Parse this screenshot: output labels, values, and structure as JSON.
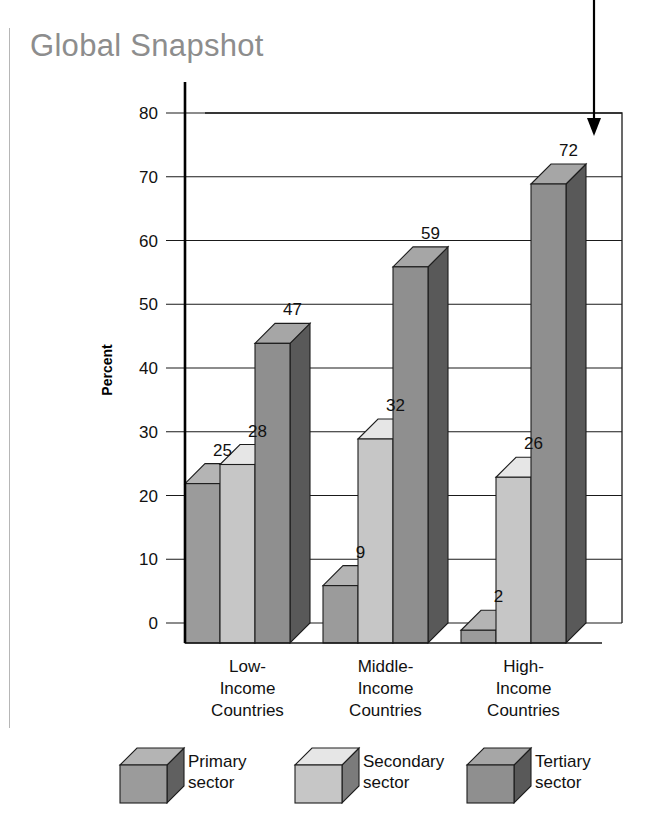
{
  "title": "Global Snapshot",
  "chart_data": {
    "type": "bar",
    "title": "Global Snapshot",
    "xlabel": "",
    "ylabel": "Percent",
    "ylim": [
      0,
      80
    ],
    "yticks": [
      0,
      10,
      20,
      30,
      40,
      50,
      60,
      70,
      80
    ],
    "ytick_labels": [
      "0",
      "10",
      "20",
      "30",
      "40",
      "50",
      "60",
      "70",
      "80"
    ],
    "grid": true,
    "legend_position": "bottom",
    "style": "3d-grouped-bar",
    "categories": [
      "Low-\nIncome\nCountries",
      "Middle-\nIncome\nCountries",
      "High-\nIncome\nCountries"
    ],
    "category_lines": [
      [
        "Low-",
        "Income",
        "Countries"
      ],
      [
        "Middle-",
        "Income",
        "Countries"
      ],
      [
        "High-",
        "Income",
        "Countries"
      ]
    ],
    "series": [
      {
        "name": "Primary sector",
        "values": [
          25,
          9,
          2
        ],
        "color": "#9b9b9b"
      },
      {
        "name": "Secondary sector",
        "values": [
          28,
          32,
          26
        ],
        "color": "#c6c6c6"
      },
      {
        "name": "Tertiary sector",
        "values": [
          47,
          59,
          72
        ],
        "color": "#8f8f8f"
      }
    ],
    "annotations": [
      {
        "type": "arrow",
        "target_label": "72",
        "direction": "down"
      }
    ]
  },
  "legend": {
    "items": [
      {
        "label_line1": "Primary",
        "label_line2": "sector",
        "color": "#9b9b9b"
      },
      {
        "label_line1": "Secondary",
        "label_line2": "sector",
        "color": "#c6c6c6"
      },
      {
        "label_line1": "Tertiary",
        "label_line2": "sector",
        "color": "#8f8f8f"
      }
    ]
  },
  "colors": {
    "primary_face": "#9b9b9b",
    "secondary_face": "#c6c6c6",
    "tertiary_face": "#8f8f8f",
    "title_gray": "#8d8d8d",
    "axis_black": "#1a1a1a"
  }
}
